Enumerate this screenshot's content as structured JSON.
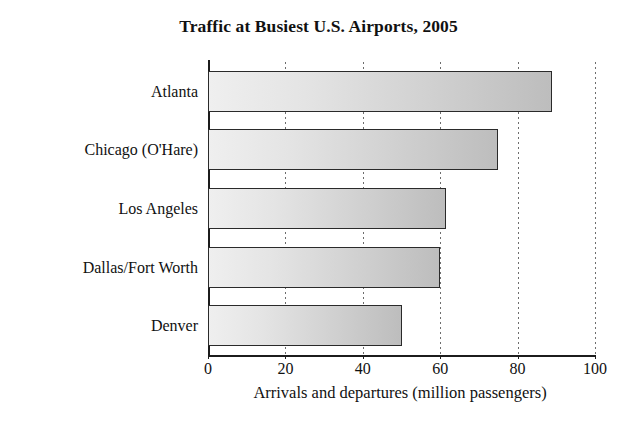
{
  "chart_data": {
    "type": "bar",
    "orientation": "horizontal",
    "title": "Traffic at Busiest U.S. Airports, 2005",
    "categories": [
      "Atlanta",
      "Chicago (O'Hare)",
      "Los Angeles",
      "Dallas/Fort Worth",
      "Denver"
    ],
    "values": [
      89,
      75,
      61.5,
      60,
      50
    ],
    "xlabel": "Arrivals and departures (million passengers)",
    "ylabel": "",
    "xlim": [
      0,
      100
    ],
    "xticks": [
      0,
      20,
      40,
      60,
      80,
      100
    ],
    "xtick_labels": [
      "0",
      "20",
      "40",
      "60",
      "80",
      "100"
    ],
    "grid": "vertical-dotted",
    "legend": "none",
    "series": [
      {
        "name": "Arrivals and departures (million passengers)",
        "values": [
          89,
          75,
          61.5,
          60,
          50
        ]
      }
    ],
    "colors": {
      "bar_fill_light": "#efefef",
      "bar_fill_dark": "#bdbdbd",
      "bar_border": "#2a2a2a",
      "axis": "#1c1c1c",
      "gridline": "#6d6d6d",
      "text": "#111111",
      "background": "#ffffff"
    }
  }
}
